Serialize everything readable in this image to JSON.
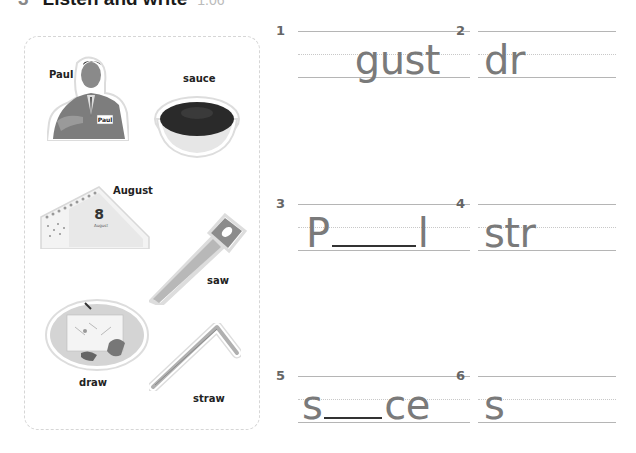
{
  "heading": {
    "number": "3",
    "title": "Listen and write",
    "track": "1.06"
  },
  "pictures": [
    {
      "label": "Paul",
      "icon": "man-pointing-name-badge-photo",
      "badge_text": "Paul"
    },
    {
      "label": "sauce",
      "icon": "bowl-of-sauce-photo"
    },
    {
      "label": "August",
      "icon": "calendar-august-8-photo",
      "calendar_day": "8",
      "calendar_month": "August"
    },
    {
      "label": "saw",
      "icon": "hand-saw-photo"
    },
    {
      "label": "draw",
      "icon": "child-drawing-photo"
    },
    {
      "label": "straw",
      "icon": "bent-drinking-straw-photo"
    }
  ],
  "exercises": [
    {
      "number": "1",
      "prefix": "",
      "blank": false,
      "suffix": "gust",
      "align": "right"
    },
    {
      "number": "2",
      "prefix": "dr",
      "blank": false,
      "suffix": "",
      "align": "left"
    },
    {
      "number": "3",
      "prefix": "P",
      "blank": true,
      "suffix": "l",
      "align": "left"
    },
    {
      "number": "4",
      "prefix": "str",
      "blank": false,
      "suffix": "",
      "align": "left"
    },
    {
      "number": "5",
      "prefix": "s",
      "blank": true,
      "suffix": "ce",
      "align": "left"
    },
    {
      "number": "6",
      "prefix": "s",
      "blank": false,
      "suffix": "",
      "align": "left"
    }
  ]
}
